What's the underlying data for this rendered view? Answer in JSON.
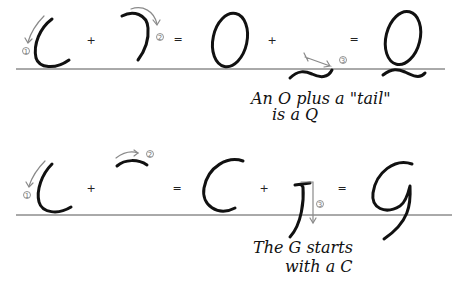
{
  "rows": [
    {
      "id": "q-row",
      "equation": [
        "C stroke",
        "+",
        "reverse C stroke",
        "=",
        "O",
        "+",
        "tail",
        "=",
        "Q"
      ],
      "operators": {
        "plus1": "+",
        "equals1": "=",
        "plus2": "+",
        "equals2": "="
      },
      "step_numbers": [
        "1",
        "2",
        "3"
      ],
      "caption_line1": "An O plus a \"tail\"",
      "caption_line2": "is a Q"
    },
    {
      "id": "g-row",
      "equation": [
        "C stroke",
        "+",
        "top arc",
        "=",
        "C",
        "+",
        "J stroke",
        "=",
        "G"
      ],
      "operators": {
        "plus1": "+",
        "equals1": "=",
        "plus2": "+",
        "equals2": "="
      },
      "step_numbers": [
        "1",
        "2",
        "3"
      ],
      "caption_line1": "The G starts",
      "caption_line2": "with a C"
    }
  ],
  "colors": {
    "ink": "#111111",
    "guide": "#8a8a8a",
    "baseline": "#555555"
  }
}
